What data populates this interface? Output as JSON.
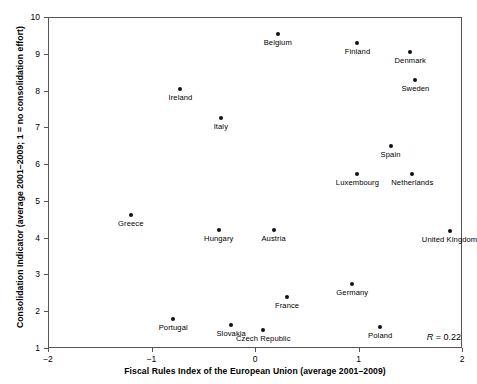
{
  "chart_data": {
    "type": "scatter",
    "title": "",
    "xlabel": "Fiscal Rules Index of the European Union (average 2001–2009)",
    "ylabel": "Consolidation Indicator (average 2001–2009; 1 = no consolidation effort)",
    "xlim": [
      -2,
      2
    ],
    "ylim": [
      1,
      10
    ],
    "xticks": [
      -2,
      -1,
      0,
      1,
      2
    ],
    "xticklabels": [
      "−2",
      "−1",
      "0",
      "1",
      "2"
    ],
    "yticks": [
      1,
      2,
      3,
      4,
      5,
      6,
      7,
      8,
      9,
      10
    ],
    "yticklabels": [
      "1",
      "2",
      "3",
      "4",
      "5",
      "6",
      "7",
      "8",
      "9",
      "10"
    ],
    "grid": false,
    "legend": null,
    "marker": "filled-circle",
    "marker_color": "#111111",
    "annotations": [
      {
        "text": "R = 0.22",
        "symbol": "R",
        "value": "= 0.22",
        "position": "bottom-right"
      }
    ],
    "points": [
      {
        "label": "Belgium",
        "x": 0.22,
        "y": 9.55,
        "label_pos": "below"
      },
      {
        "label": "Finland",
        "x": 0.99,
        "y": 9.3,
        "label_pos": "below"
      },
      {
        "label": "Denmark",
        "x": 1.5,
        "y": 9.05,
        "label_pos": "below"
      },
      {
        "label": "Sweden",
        "x": 1.55,
        "y": 8.3,
        "label_pos": "below"
      },
      {
        "label": "Ireland",
        "x": -0.72,
        "y": 8.05,
        "label_pos": "below"
      },
      {
        "label": "Italy",
        "x": -0.33,
        "y": 7.25,
        "label_pos": "below"
      },
      {
        "label": "Spain",
        "x": 1.31,
        "y": 6.5,
        "label_pos": "below"
      },
      {
        "label": "Luxembourg",
        "x": 0.99,
        "y": 5.72,
        "label_pos": "below"
      },
      {
        "label": "Netherlands",
        "x": 1.52,
        "y": 5.72,
        "label_pos": "below"
      },
      {
        "label": "Greece",
        "x": -1.2,
        "y": 4.62,
        "label_pos": "below"
      },
      {
        "label": "Hungary",
        "x": -0.35,
        "y": 4.22,
        "label_pos": "below"
      },
      {
        "label": "Austria",
        "x": 0.18,
        "y": 4.22,
        "label_pos": "below"
      },
      {
        "label": "United Kingdom",
        "x": 1.88,
        "y": 4.18,
        "label_pos": "below"
      },
      {
        "label": "Germany",
        "x": 0.94,
        "y": 2.73,
        "label_pos": "below"
      },
      {
        "label": "France",
        "x": 0.31,
        "y": 2.4,
        "label_pos": "below"
      },
      {
        "label": "Portugal",
        "x": -0.79,
        "y": 1.78,
        "label_pos": "below"
      },
      {
        "label": "Slovakia",
        "x": -0.23,
        "y": 1.62,
        "label_pos": "below"
      },
      {
        "label": "Czech Republic",
        "x": 0.08,
        "y": 1.5,
        "label_pos": "below"
      },
      {
        "label": "Poland",
        "x": 1.21,
        "y": 1.58,
        "label_pos": "below"
      }
    ]
  }
}
